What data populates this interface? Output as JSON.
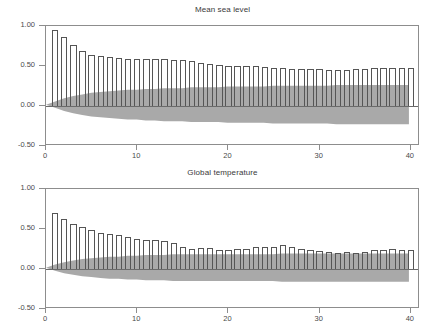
{
  "chart_data": [
    {
      "type": "bar",
      "title": "Mean sea level",
      "xlabel": "",
      "ylabel": "",
      "xlim": [
        0,
        41
      ],
      "ylim": [
        -0.5,
        1.0
      ],
      "xticks": [
        0,
        10,
        20,
        30,
        40
      ],
      "xticklabels": [
        "0",
        "10",
        "20",
        "30",
        "40"
      ],
      "yticks": [
        -0.5,
        0.0,
        0.5,
        1.0
      ],
      "yticklabels": [
        "-0.50",
        "0.00",
        "0.50",
        "1.00"
      ],
      "grid": false,
      "legend": "none",
      "series_name": "autocorrelation",
      "categories": [
        1,
        2,
        3,
        4,
        5,
        6,
        7,
        8,
        9,
        10,
        11,
        12,
        13,
        14,
        15,
        16,
        17,
        18,
        19,
        20,
        21,
        22,
        23,
        24,
        25,
        26,
        27,
        28,
        29,
        30,
        31,
        32,
        33,
        34,
        35,
        36,
        37,
        38,
        39,
        40
      ],
      "values": [
        0.95,
        0.86,
        0.76,
        0.69,
        0.64,
        0.63,
        0.61,
        0.6,
        0.59,
        0.59,
        0.59,
        0.59,
        0.59,
        0.58,
        0.57,
        0.56,
        0.54,
        0.53,
        0.51,
        0.5,
        0.5,
        0.5,
        0.5,
        0.49,
        0.47,
        0.47,
        0.46,
        0.46,
        0.46,
        0.46,
        0.45,
        0.45,
        0.45,
        0.46,
        0.46,
        0.47,
        0.47,
        0.48,
        0.48,
        0.47
      ],
      "confidence_band_upper": [
        0.04,
        0.08,
        0.11,
        0.13,
        0.15,
        0.16,
        0.17,
        0.18,
        0.19,
        0.19,
        0.2,
        0.2,
        0.21,
        0.21,
        0.21,
        0.22,
        0.22,
        0.22,
        0.22,
        0.23,
        0.23,
        0.23,
        0.23,
        0.23,
        0.24,
        0.24,
        0.24,
        0.24,
        0.24,
        0.24,
        0.24,
        0.25,
        0.25,
        0.25,
        0.25,
        0.25,
        0.25,
        0.25,
        0.25,
        0.25
      ],
      "confidence_band_lower": [
        -0.04,
        -0.08,
        -0.11,
        -0.13,
        -0.15,
        -0.16,
        -0.17,
        -0.18,
        -0.19,
        -0.19,
        -0.2,
        -0.2,
        -0.21,
        -0.21,
        -0.21,
        -0.22,
        -0.22,
        -0.22,
        -0.22,
        -0.23,
        -0.23,
        -0.23,
        -0.23,
        -0.23,
        -0.24,
        -0.24,
        -0.24,
        -0.24,
        -0.24,
        -0.24,
        -0.24,
        -0.25,
        -0.25,
        -0.25,
        -0.25,
        -0.25,
        -0.25,
        -0.25,
        -0.25,
        -0.25
      ]
    },
    {
      "type": "bar",
      "title": "Global temperature",
      "xlabel": "",
      "ylabel": "",
      "xlim": [
        0,
        41
      ],
      "ylim": [
        -0.5,
        1.0
      ],
      "xticks": [
        0,
        10,
        20,
        30,
        40
      ],
      "xticklabels": [
        "0",
        "10",
        "20",
        "30",
        "40"
      ],
      "yticks": [
        -0.5,
        0.0,
        0.5,
        1.0
      ],
      "yticklabels": [
        "-0.50",
        "0.00",
        "0.50",
        "1.00"
      ],
      "grid": false,
      "legend": "none",
      "series_name": "autocorrelation",
      "categories": [
        1,
        2,
        3,
        4,
        5,
        6,
        7,
        8,
        9,
        10,
        11,
        12,
        13,
        14,
        15,
        16,
        17,
        18,
        19,
        20,
        21,
        22,
        23,
        24,
        25,
        26,
        27,
        28,
        29,
        30,
        31,
        32,
        33,
        34,
        35,
        36,
        37,
        38,
        39,
        40
      ],
      "values": [
        0.7,
        0.62,
        0.56,
        0.53,
        0.49,
        0.45,
        0.44,
        0.43,
        0.4,
        0.38,
        0.36,
        0.36,
        0.35,
        0.32,
        0.28,
        0.25,
        0.26,
        0.26,
        0.24,
        0.24,
        0.25,
        0.25,
        0.27,
        0.27,
        0.28,
        0.3,
        0.27,
        0.25,
        0.24,
        0.23,
        0.21,
        0.2,
        0.21,
        0.2,
        0.21,
        0.24,
        0.24,
        0.25,
        0.24,
        0.24
      ],
      "confidence_band_upper": [
        0.04,
        0.07,
        0.09,
        0.11,
        0.12,
        0.13,
        0.14,
        0.14,
        0.15,
        0.15,
        0.16,
        0.16,
        0.16,
        0.17,
        0.17,
        0.17,
        0.17,
        0.17,
        0.17,
        0.17,
        0.17,
        0.17,
        0.17,
        0.17,
        0.17,
        0.18,
        0.18,
        0.18,
        0.18,
        0.18,
        0.18,
        0.18,
        0.18,
        0.18,
        0.18,
        0.18,
        0.18,
        0.18,
        0.18,
        0.18
      ],
      "confidence_band_lower": [
        -0.04,
        -0.07,
        -0.09,
        -0.11,
        -0.12,
        -0.13,
        -0.14,
        -0.14,
        -0.15,
        -0.15,
        -0.16,
        -0.16,
        -0.16,
        -0.17,
        -0.17,
        -0.17,
        -0.17,
        -0.17,
        -0.17,
        -0.17,
        -0.17,
        -0.17,
        -0.17,
        -0.17,
        -0.17,
        -0.18,
        -0.18,
        -0.18,
        -0.18,
        -0.18,
        -0.18,
        -0.18,
        -0.18,
        -0.18,
        -0.18,
        -0.18,
        -0.18,
        -0.18,
        -0.18,
        -0.18
      ]
    }
  ],
  "style": {
    "band_color": "#a9a9a9",
    "bar_edge_color": "#555555",
    "frame_color": "#8d8d8d",
    "text_color": "#4a4a4a",
    "background": "#ffffff"
  }
}
